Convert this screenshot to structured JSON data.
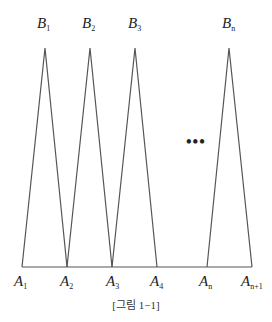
{
  "diagram": {
    "top_labels": [
      {
        "letter": "B",
        "sub": "1"
      },
      {
        "letter": "B",
        "sub": "2"
      },
      {
        "letter": "B",
        "sub": "3"
      },
      {
        "letter": "B",
        "sub": "n"
      }
    ],
    "bottom_labels": [
      {
        "letter": "A",
        "sub": "1"
      },
      {
        "letter": "A",
        "sub": "2"
      },
      {
        "letter": "A",
        "sub": "3"
      },
      {
        "letter": "A",
        "sub": "4"
      },
      {
        "letter": "A",
        "sub": "n"
      },
      {
        "letter": "A",
        "sub": "n+1"
      }
    ],
    "ellipsis": "•••",
    "caption": "[그림 1−1]",
    "line_color": "#555555"
  }
}
